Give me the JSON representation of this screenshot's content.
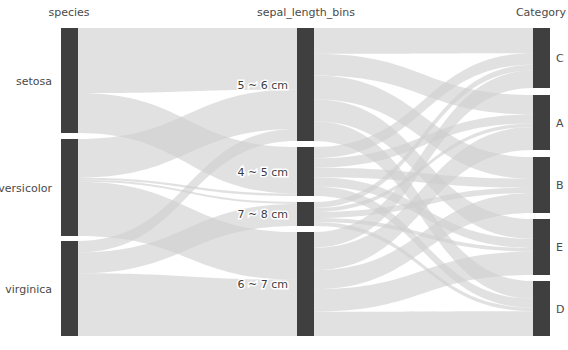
{
  "chart_data": {
    "type": "parallel-categories",
    "title": "",
    "dimensions": [
      {
        "name": "species",
        "title": "species",
        "label_position": "left",
        "categories": [
          {
            "label": "setosa",
            "count": 50,
            "y0": 28,
            "y1": 133
          },
          {
            "label": "versicolor",
            "count": 50,
            "y0": 139,
            "y1": 236
          },
          {
            "label": "virginica",
            "count": 50,
            "y0": 241,
            "y1": 336
          }
        ]
      },
      {
        "name": "sepal_length_bins",
        "title": "sepal_length_bins",
        "label_position": "inside",
        "categories": [
          {
            "label": "5 ~ 6 cm",
            "count": 57,
            "y0": 28,
            "y1": 141
          },
          {
            "label": "4 ~ 5 cm",
            "count": 26,
            "y0": 147,
            "y1": 196
          },
          {
            "label": "7 ~ 8 cm",
            "count": 12,
            "y0": 202,
            "y1": 226
          },
          {
            "label": "6 ~ 7 cm",
            "count": 55,
            "y0": 232,
            "y1": 336
          }
        ]
      },
      {
        "name": "Category",
        "title": "Category",
        "label_position": "right",
        "categories": [
          {
            "label": "C",
            "count": 31,
            "y0": 28,
            "y1": 88
          },
          {
            "label": "A",
            "count": 31,
            "y0": 95,
            "y1": 150
          },
          {
            "label": "B",
            "count": 31,
            "y0": 157,
            "y1": 213
          },
          {
            "label": "E",
            "count": 31,
            "y0": 219,
            "y1": 275
          },
          {
            "label": "D",
            "count": 31,
            "y0": 281,
            "y1": 336
          }
        ]
      }
    ],
    "links_left": [
      {
        "source": "setosa",
        "target": "5 ~ 6 cm",
        "value": 31
      },
      {
        "source": "setosa",
        "target": "4 ~ 5 cm",
        "value": 19
      },
      {
        "source": "versicolor",
        "target": "5 ~ 6 cm",
        "value": 20
      },
      {
        "source": "versicolor",
        "target": "4 ~ 5 cm",
        "value": 1
      },
      {
        "source": "versicolor",
        "target": "7 ~ 8 cm",
        "value": 1
      },
      {
        "source": "versicolor",
        "target": "6 ~ 7 cm",
        "value": 28
      },
      {
        "source": "virginica",
        "target": "5 ~ 6 cm",
        "value": 6
      },
      {
        "source": "virginica",
        "target": "7 ~ 8 cm",
        "value": 11
      },
      {
        "source": "virginica",
        "target": "6 ~ 7 cm",
        "value": 33
      }
    ],
    "links_right": [
      {
        "source": "5 ~ 6 cm",
        "target": "C",
        "value": 13
      },
      {
        "source": "5 ~ 6 cm",
        "target": "A",
        "value": 11
      },
      {
        "source": "5 ~ 6 cm",
        "target": "B",
        "value": 12
      },
      {
        "source": "5 ~ 6 cm",
        "target": "E",
        "value": 11
      },
      {
        "source": "5 ~ 6 cm",
        "target": "D",
        "value": 10
      },
      {
        "source": "4 ~ 5 cm",
        "target": "C",
        "value": 6
      },
      {
        "source": "4 ~ 5 cm",
        "target": "A",
        "value": 5
      },
      {
        "source": "4 ~ 5 cm",
        "target": "B",
        "value": 5
      },
      {
        "source": "4 ~ 5 cm",
        "target": "E",
        "value": 5
      },
      {
        "source": "4 ~ 5 cm",
        "target": "D",
        "value": 5
      },
      {
        "source": "7 ~ 8 cm",
        "target": "C",
        "value": 3
      },
      {
        "source": "7 ~ 8 cm",
        "target": "A",
        "value": 2
      },
      {
        "source": "7 ~ 8 cm",
        "target": "B",
        "value": 3
      },
      {
        "source": "7 ~ 8 cm",
        "target": "E",
        "value": 2
      },
      {
        "source": "7 ~ 8 cm",
        "target": "D",
        "value": 2
      },
      {
        "source": "6 ~ 7 cm",
        "target": "C",
        "value": 9
      },
      {
        "source": "6 ~ 7 cm",
        "target": "A",
        "value": 13
      },
      {
        "source": "6 ~ 7 cm",
        "target": "B",
        "value": 11
      },
      {
        "source": "6 ~ 7 cm",
        "target": "E",
        "value": 13
      },
      {
        "source": "6 ~ 7 cm",
        "target": "D",
        "value": 14
      }
    ],
    "colors": {
      "background": "#ffffff",
      "bar": "#3f3f3f",
      "ribbon_light": "#cfcfcf",
      "ribbon_dark": "#a9a9a9",
      "label_text": "#4a4a4a",
      "title_text": "#4a4a4a"
    },
    "axes": {
      "species_x": 61,
      "species_width": 17,
      "sepal_x": 297,
      "sepal_width": 17,
      "category_x": 533,
      "category_width": 17,
      "top": 28,
      "bottom": 336
    }
  },
  "titles": {
    "species": "species",
    "sepal_length_bins": "sepal_length_bins",
    "category": "Category"
  },
  "labels": {
    "species": [
      "setosa",
      "versicolor",
      "virginica"
    ],
    "sepal_length_bins": [
      "5 ~ 6 cm",
      "4 ~ 5 cm",
      "7 ~ 8 cm",
      "6 ~ 7 cm"
    ],
    "category": [
      "C",
      "A",
      "B",
      "E",
      "D"
    ]
  }
}
